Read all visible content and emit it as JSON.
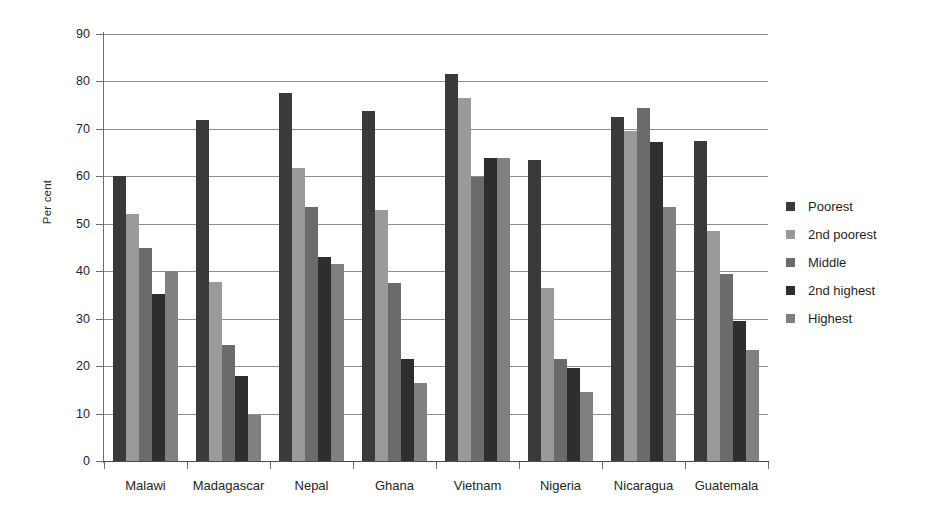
{
  "chart_data": {
    "type": "bar",
    "title": "",
    "subtitle": "",
    "xlabel": "",
    "ylabel": "Per cent",
    "ylim": [
      0,
      90
    ],
    "ytick_step": 10,
    "yticks": [
      0,
      10,
      20,
      30,
      40,
      50,
      60,
      70,
      80,
      90
    ],
    "ytick_labels": [
      "0",
      "10",
      "20",
      "30",
      "40",
      "50",
      "60",
      "70",
      "80",
      "90"
    ],
    "grid": true,
    "grid_axis": "y",
    "legend_position": "right",
    "categories": [
      "Malawi",
      "Madagascar",
      "Nepal",
      "Ghana",
      "Vietnam",
      "Nigeria",
      "Nicaragua",
      "Guatemala"
    ],
    "series": [
      {
        "name": "Poorest",
        "color": "#3a3a3a",
        "values": [
          60.0,
          71.8,
          77.5,
          73.8,
          81.5,
          63.5,
          72.5,
          67.5
        ]
      },
      {
        "name": "2nd poorest",
        "color": "#9a9a9a",
        "values": [
          52.0,
          37.8,
          61.8,
          53.0,
          76.5,
          36.5,
          69.5,
          48.5
        ]
      },
      {
        "name": "Middle",
        "color": "#6b6b6b",
        "values": [
          45.0,
          24.5,
          53.5,
          37.5,
          59.8,
          21.5,
          74.5,
          39.5
        ]
      },
      {
        "name": "2nd highest",
        "color": "#2e2e2e",
        "values": [
          35.2,
          18.0,
          43.0,
          21.5,
          63.8,
          19.5,
          67.3,
          29.5
        ]
      },
      {
        "name": "Highest",
        "color": "#808080",
        "values": [
          40.0,
          9.8,
          41.5,
          16.5,
          63.8,
          14.5,
          53.5,
          23.5
        ]
      }
    ]
  },
  "legend": {
    "items": [
      {
        "label": "Poorest"
      },
      {
        "label": "2nd poorest"
      },
      {
        "label": "Middle"
      },
      {
        "label": "2nd highest"
      },
      {
        "label": "Highest"
      }
    ]
  }
}
